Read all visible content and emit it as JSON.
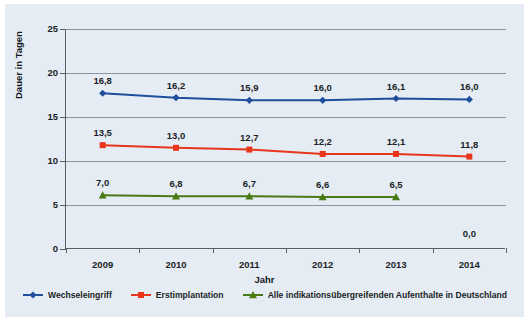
{
  "chart_data": {
    "type": "line",
    "title": "",
    "xlabel": "Jahr",
    "ylabel": "Dauer in Tagen",
    "categories": [
      "2009",
      "2010",
      "2011",
      "2012",
      "2013",
      "2014"
    ],
    "x": [
      2009,
      2010,
      2011,
      2012,
      2013,
      2014
    ],
    "xlim": [
      2008.5,
      2014.5
    ],
    "ylim": [
      0,
      25
    ],
    "yticks": [
      0,
      5,
      10,
      15,
      20,
      25
    ],
    "ytick_labels": [
      "0",
      "5",
      "10",
      "15",
      "20",
      "25"
    ],
    "grid": "horizontal",
    "legend_position": "bottom",
    "decimal_separator": ",",
    "series": [
      {
        "name": "Wechseleingriff",
        "color": "#1f4e9c",
        "marker": "diamond",
        "values": [
          16.8,
          16.2,
          15.9,
          16.0,
          16.1,
          16.0
        ],
        "labels": [
          "16,8",
          "16,2",
          "15,9",
          "16,0",
          "16,1",
          "16,0"
        ],
        "plotted": [
          17.7,
          17.2,
          16.9,
          16.9,
          17.1,
          17.0
        ]
      },
      {
        "name": "Erstimplantation",
        "color": "#e8361c",
        "marker": "square",
        "values": [
          13.5,
          13.0,
          12.7,
          12.2,
          12.1,
          11.8
        ],
        "labels": [
          "13,5",
          "13,0",
          "12,7",
          "12,2",
          "12,1",
          "11,8"
        ],
        "plotted": [
          11.8,
          11.5,
          11.3,
          10.8,
          10.8,
          10.5
        ]
      },
      {
        "name": "Alle indikationsübergreifenden Aufenthalte in Deutschland",
        "color": "#4a7a15",
        "marker": "triangle",
        "values": [
          7.0,
          6.8,
          6.7,
          6.6,
          6.5,
          null
        ],
        "labels": [
          "7,0",
          "6,8",
          "6,7",
          "6,6",
          "6,5",
          "0,0"
        ],
        "plotted": [
          6.1,
          6.0,
          6.0,
          5.9,
          5.9,
          null
        ]
      }
    ],
    "annotations": [
      {
        "text": "0,0",
        "x": 2014,
        "y": 2.3
      }
    ]
  }
}
